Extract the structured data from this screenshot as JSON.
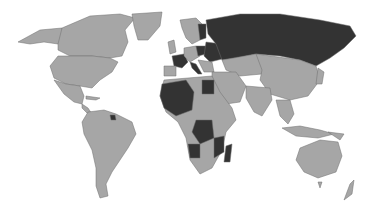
{
  "map": {
    "type": "world choropleth",
    "projection": "Robinson-like",
    "colors": {
      "background": "#ffffff",
      "land": "#a6a6a6",
      "highlighted": "#333333",
      "border": "#6e6e6e"
    },
    "legend": "none",
    "highlighted_regions": [
      "Russia",
      "France",
      "Poland",
      "Belarus",
      "Ukraine",
      "Finland",
      "Algeria",
      "Mali",
      "Niger",
      "Mauritania",
      "Egypt",
      "Democratic Republic of the Congo",
      "Angola",
      "Mozambique",
      "Madagascar",
      "Tanzania",
      "Zambia",
      "Burkina Faso",
      "Chad",
      "Italy",
      "Romania",
      "Bulgaria",
      "Hungary",
      "Kazakhstan",
      "Suriname"
    ]
  }
}
